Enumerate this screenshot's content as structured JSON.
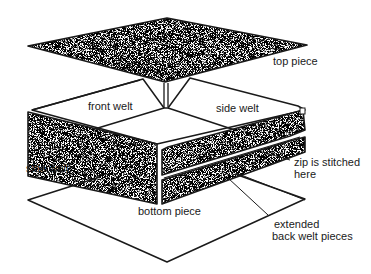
{
  "diagram": {
    "type": "exploded-view",
    "colors": {
      "background": "#ffffff",
      "ink": "#1a1a1a",
      "fabric_speckle": "#555555"
    },
    "labels": {
      "top_piece": "top piece",
      "front_welt": "front welt",
      "side_welt_right": "side welt",
      "side_welt_left": "side welt",
      "zip_line1": "zip is stitched",
      "zip_line2": "here",
      "bottom_piece": "bottom piece",
      "extended_line1": "extended",
      "extended_line2": "back welt pieces"
    }
  }
}
